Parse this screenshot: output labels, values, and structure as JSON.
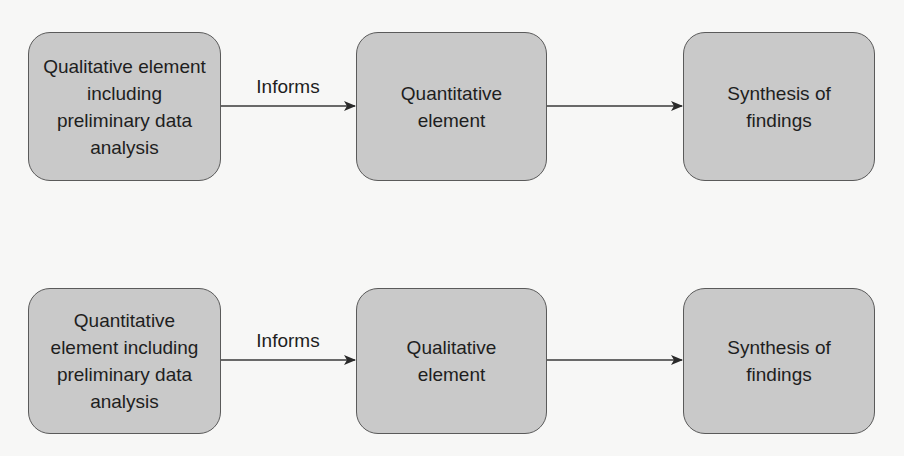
{
  "diagram": {
    "type": "flowchart",
    "colors": {
      "background": "#f7f7f6",
      "node_fill": "#c9c9c9",
      "node_border": "#5a5a5a",
      "edge": "#3a3a3a",
      "text": "#1e1e1e"
    },
    "rows": [
      {
        "nodes": [
          {
            "id": "r1n1",
            "label": "Qualitative element\nincluding\npreliminary data\nanalysis"
          },
          {
            "id": "r1n2",
            "label": "Quantitative\nelement"
          },
          {
            "id": "r1n3",
            "label": "Synthesis of\nfindings"
          }
        ],
        "edges": [
          {
            "from": "r1n1",
            "to": "r1n2",
            "label": "Informs"
          },
          {
            "from": "r1n2",
            "to": "r1n3",
            "label": ""
          }
        ]
      },
      {
        "nodes": [
          {
            "id": "r2n1",
            "label": "Quantitative\nelement including\npreliminary data\nanalysis"
          },
          {
            "id": "r2n2",
            "label": "Qualitative\nelement"
          },
          {
            "id": "r2n3",
            "label": "Synthesis of\nfindings"
          }
        ],
        "edges": [
          {
            "from": "r2n1",
            "to": "r2n2",
            "label": "Informs"
          },
          {
            "from": "r2n2",
            "to": "r2n3",
            "label": ""
          }
        ]
      }
    ]
  }
}
